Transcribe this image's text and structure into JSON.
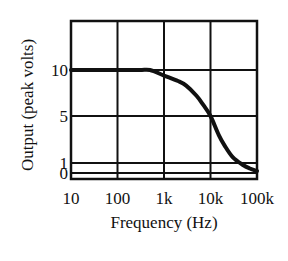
{
  "chart_data": {
    "type": "line",
    "title": "",
    "xlabel": "Frequency (Hz)",
    "ylabel": "Output (peak volts)",
    "xscale": "log",
    "xlim": [
      10,
      100000
    ],
    "ylim": [
      -0.6,
      15
    ],
    "grid": true,
    "legend": null,
    "x_ticks": [
      {
        "value": 10,
        "label": "10"
      },
      {
        "value": 100,
        "label": "100"
      },
      {
        "value": 1000,
        "label": "1k"
      },
      {
        "value": 10000,
        "label": "10k"
      },
      {
        "value": 100000,
        "label": "100k"
      }
    ],
    "y_ticks": [
      {
        "value": 10,
        "label": "10"
      },
      {
        "value": 5,
        "label": "5"
      },
      {
        "value": 1,
        "label": "1"
      },
      {
        "value": 0,
        "label": "0"
      }
    ],
    "series": [
      {
        "name": "Output",
        "color": "#111111",
        "x": [
          10,
          100,
          300,
          500,
          1000,
          2000,
          3000,
          5000,
          7000,
          10000,
          15000,
          20000,
          30000,
          50000,
          70000,
          100000
        ],
        "values": [
          10,
          10,
          10,
          10,
          9.4,
          8.8,
          8.3,
          7.2,
          6.2,
          5.0,
          3.4,
          2.5,
          1.5,
          0.8,
          0.45,
          0.2
        ]
      }
    ]
  }
}
